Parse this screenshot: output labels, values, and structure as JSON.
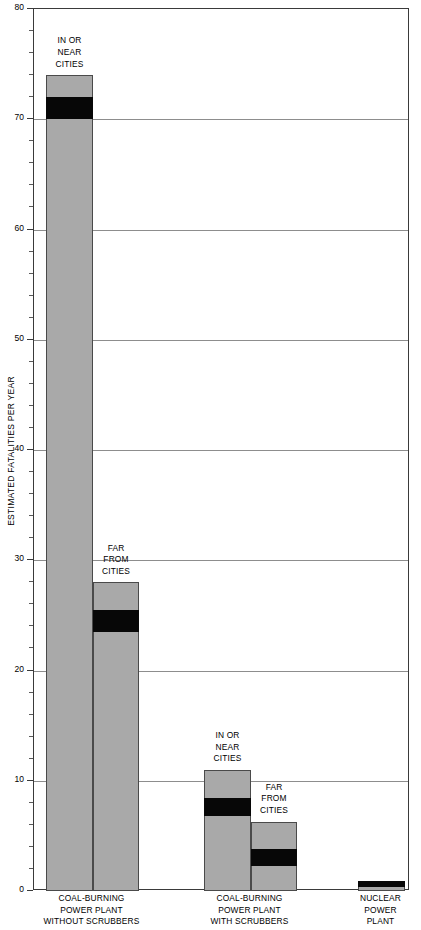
{
  "chart_data": {
    "type": "bar",
    "title": "",
    "subtitle": "",
    "xlabel": "",
    "ylabel": "ESTIMATED FATALITIES PER YEAR",
    "ylim": [
      0,
      80
    ],
    "ytick_labels": [
      "0",
      "10",
      "20",
      "30",
      "40",
      "50",
      "60",
      "70",
      "80"
    ],
    "ytick_values": [
      0,
      10,
      20,
      30,
      40,
      50,
      60,
      70,
      80
    ],
    "minor_tick_step": 2,
    "grid": "horizontal",
    "legend": "none",
    "categories": [
      "COAL-BURNING\nPOWER PLANT\nWITHOUT SCRUBBERS",
      "COAL-BURNING\nPOWER PLANT\nWITH SCRUBBERS",
      "NUCLEAR\nPOWER\nPLANT"
    ],
    "bars": [
      {
        "group": "COAL-BURNING POWER PLANT WITHOUT SCRUBBERS",
        "annotation": "IN OR\nNEAR\nCITIES",
        "total": 74,
        "band_low": 70,
        "band_high": 72
      },
      {
        "group": "COAL-BURNING POWER PLANT WITHOUT SCRUBBERS",
        "annotation": "FAR\nFROM\nCITIES",
        "total": 28,
        "band_low": 23.5,
        "band_high": 25.5
      },
      {
        "group": "COAL-BURNING POWER PLANT WITH SCRUBBERS",
        "annotation": "IN OR\nNEAR\nCITIES",
        "total": 11,
        "band_low": 6.8,
        "band_high": 8.4
      },
      {
        "group": "COAL-BURNING POWER PLANT WITH SCRUBBERS",
        "annotation": "FAR\nFROM\nCITIES",
        "total": 6.3,
        "band_low": 2.3,
        "band_high": 3.8
      },
      {
        "group": "NUCLEAR POWER PLANT",
        "annotation": "",
        "total": 0.9,
        "band_low": 0.35,
        "band_high": 0.9
      }
    ],
    "colors": {
      "bar_fill": "#a9a9a9",
      "band_fill": "#070707",
      "bar_stroke": "#4a4a4a",
      "gridline": "#8d8d8d",
      "axis": "#3a3a3a",
      "text": "#000000",
      "background": "#ffffff"
    }
  },
  "axis": {
    "y_title": "ESTIMATED FATALITIES PER YEAR"
  },
  "group_captions": [
    "COAL-BURNING\nPOWER PLANT\nWITHOUT SCRUBBERS",
    "COAL-BURNING\nPOWER PLANT\nWITH SCRUBBERS",
    "NUCLEAR\nPOWER\nPLANT"
  ],
  "bar_annotations": [
    "IN OR\nNEAR\nCITIES",
    "FAR\nFROM\nCITIES",
    "IN OR\nNEAR\nCITIES",
    "FAR\nFROM\nCITIES",
    ""
  ],
  "ytick_labels": [
    "0",
    "10",
    "20",
    "30",
    "40",
    "50",
    "60",
    "70",
    "80"
  ]
}
